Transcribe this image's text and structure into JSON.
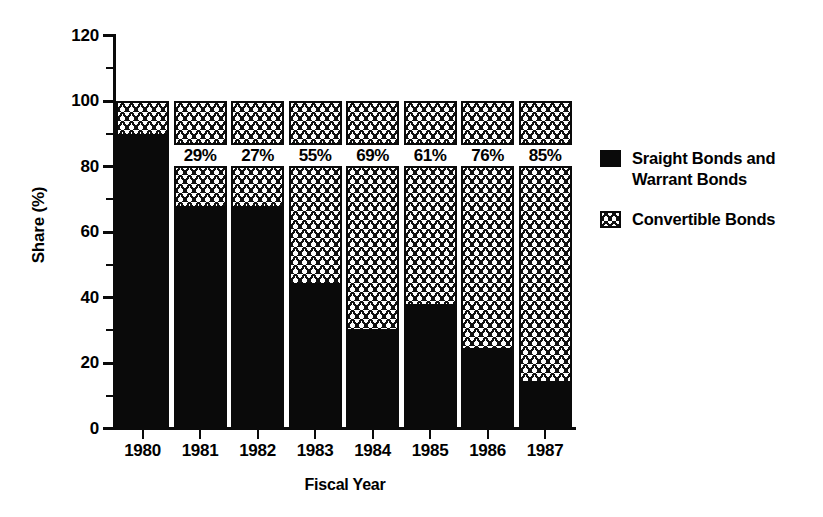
{
  "chart_data": {
    "type": "bar",
    "subtype": "stacked-100",
    "title": "",
    "xlabel": "Fiscal Year",
    "ylabel": "Share (%)",
    "ylim": [
      0,
      120
    ],
    "ytick_labels": [
      "0",
      "20",
      "40",
      "60",
      "80",
      "100",
      "120"
    ],
    "ytick_values": [
      0,
      20,
      40,
      60,
      80,
      100,
      120
    ],
    "minor_tick_values": [
      10,
      30,
      50,
      70,
      90,
      110
    ],
    "grid": false,
    "legend_position": "right",
    "categories": [
      "1980",
      "1981",
      "1982",
      "1983",
      "1984",
      "1985",
      "1986",
      "1987"
    ],
    "series": [
      {
        "name": "Sraight Bonds and\nWarrant Bonds",
        "pattern": "solid-black",
        "color": "#0a0a0a",
        "values": [
          90,
          68,
          68,
          44.5,
          30.5,
          38,
          24.5,
          14.5
        ]
      },
      {
        "name": "Convertible Bonds",
        "pattern": "hatch",
        "color": "#ffffff",
        "values": [
          10,
          32,
          32,
          55.5,
          69.5,
          62,
          75.5,
          85.5
        ]
      }
    ],
    "data_labels": [
      null,
      "29%",
      "27%",
      "55%",
      "69%",
      "61%",
      "76%",
      "85%"
    ]
  },
  "legend": {
    "entries": [
      {
        "label": "Sraight Bonds and\nWarrant Bonds",
        "swatch": "black-square-swatch"
      },
      {
        "label": "Convertible Bonds",
        "swatch": "hatched-square-swatch"
      }
    ]
  }
}
